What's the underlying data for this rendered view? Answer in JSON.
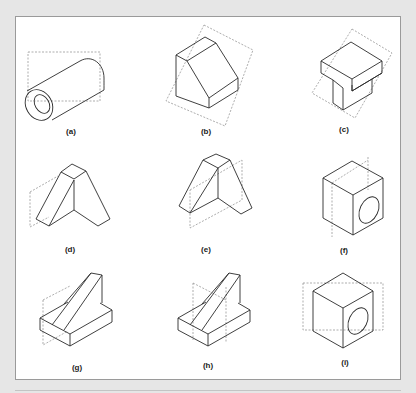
{
  "figure": {
    "panel_colors": {
      "background": "#e6e6e6",
      "panel": "#ffffff",
      "border": "#9a9a9a",
      "stroke": "#2a2a2a",
      "dashed": "#8a8a8a"
    },
    "items": [
      {
        "id": "a",
        "label": "(a)",
        "shape": "hollow cylinder",
        "plane": "dashed rectangle behind"
      },
      {
        "id": "b",
        "label": "(b)",
        "shape": "block with inclined face",
        "plane": "dashed inclined plane"
      },
      {
        "id": "c",
        "label": "(c)",
        "shape": "T-shaped block",
        "plane": "dashed inclined plane"
      },
      {
        "id": "d",
        "label": "(d)",
        "shape": "A-frame",
        "plane": "dashed plane left"
      },
      {
        "id": "e",
        "label": "(e)",
        "shape": "A-frame",
        "plane": "dashed plane right"
      },
      {
        "id": "f",
        "label": "(f)",
        "shape": "cube with hole",
        "plane": "dashed vertical plane"
      },
      {
        "id": "g",
        "label": "(g)",
        "shape": "slab with inclined bar",
        "plane": "dashed plane left"
      },
      {
        "id": "h",
        "label": "(h)",
        "shape": "slab with inclined bar",
        "plane": "dashed vertical plane middle"
      },
      {
        "id": "i",
        "label": "(i)",
        "shape": "cube with hole",
        "plane": "dashed horizontal rectangle"
      }
    ]
  }
}
